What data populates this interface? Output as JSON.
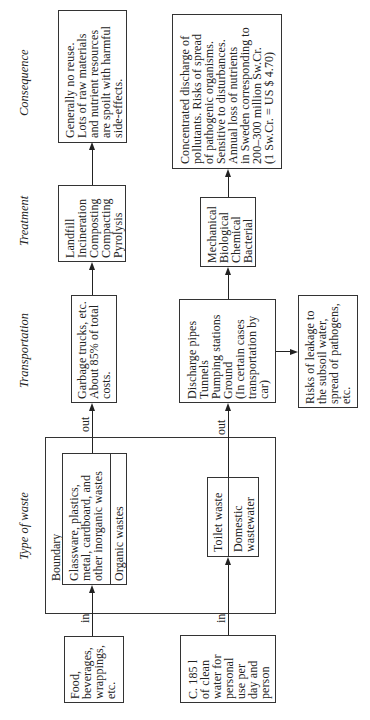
{
  "columns": {
    "consequence": "Consequence",
    "treatment": "Treatment",
    "transportation": "Transportation",
    "type_of_waste": "Type of waste"
  },
  "boundary_label": "Boundary",
  "solid_waste": {
    "input": "Food,\nbeverages,\nwrappings,\netc.",
    "in_label": "in",
    "type_inorganic": "Glassware, plastics,\nmetal, cardboard, and\nother inorganic wastes",
    "type_organic": "Organic wastes",
    "out_label": "out",
    "transportation": "Garbage trucks, etc.\nAbout 85% of total\ncosts.",
    "treatment": "Landfill\nIncineration\nComposting\nCompacting\nPyrolysis",
    "consequence": "Generally no reuse.\nLots of raw materials\nand nutrient resources\nare spoilt with harmful\nside-effects."
  },
  "wastewater": {
    "input": "C. 185 l\nof clean\nwater for\npersonal\nuse per\nday and\nperson",
    "in_label": "in",
    "type_toilet": "Toilet waste",
    "type_domestic": "Domestic\nwastewater",
    "out_label": "out",
    "transportation": "Discharge pipes\nTunnels\nPumping stations\nGround\n(In certain cases\ntransportation by\ncar)",
    "side_risk": "Risks of leakage to\nthe subsoil water,\nspread of pathogens,\netc.",
    "treatment": "Mechanical\nBiological\nChemical\nBacterial",
    "consequence": "Concentrated discharge of\npollutants. Risks of spread\nof pathogenic organisms.\nSensitive to disturbances.\nAnnual loss of nutrients\nin Sweden corresponding to\n200–300 million Sw.Cr.\n(1 Sw.Cr. = US $ 4.70)"
  }
}
